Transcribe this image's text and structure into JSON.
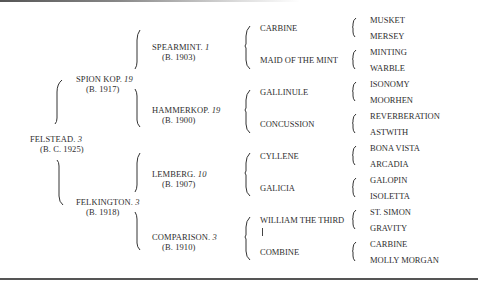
{
  "root": {
    "name": "FELSTEAD.",
    "num": "3",
    "born": "(B. C. 1925)"
  },
  "gen1": [
    {
      "name": "SPION KOP.",
      "num": "19",
      "born": "(B. 1917)"
    },
    {
      "name": "FELKINGTON.",
      "num": "3",
      "born": "(B. 1918)"
    }
  ],
  "gen2": [
    {
      "name": "SPEARMINT.",
      "num": "1",
      "born": "(B. 1903)"
    },
    {
      "name": "HAMMERKOP.",
      "num": "19",
      "born": "(B. 1900)"
    },
    {
      "name": "LEMBERG.",
      "num": "10",
      "born": "(B. 1907)"
    },
    {
      "name": "COMPARISON.",
      "num": "3",
      "born": "(B. 1910)"
    }
  ],
  "gen3": [
    "CARBINE",
    "MAID OF THE MINT",
    "GALLINULE",
    "CONCUSSION",
    "CYLLENE",
    "GALICIA",
    "WILLIAM THE THIRD",
    "COMBINE"
  ],
  "gen4": [
    "MUSKET",
    "MERSEY",
    "MINTING",
    "WARBLE",
    "ISONOMY",
    "MOORHEN",
    "REVERBERATION",
    "ASTWITH",
    "BONA VISTA",
    "ARCADIA",
    "GALOPIN",
    "ISOLETTA",
    "ST. SIMON",
    "GRAVITY",
    "CARBINE",
    "MOLLY MORGAN"
  ]
}
